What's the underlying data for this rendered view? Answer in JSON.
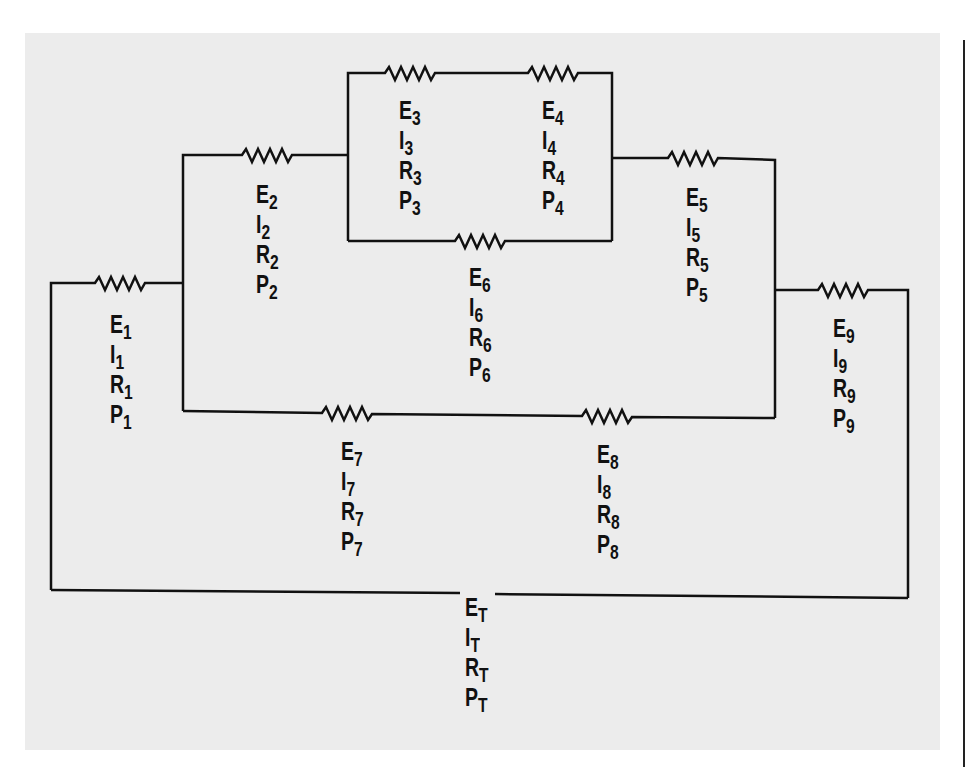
{
  "diagram": {
    "type": "series-parallel resistor circuit",
    "colors": {
      "background": "#ffffff",
      "panel": "#ececec",
      "ink": "#111111"
    },
    "components": [
      {
        "id": "R1",
        "labels": [
          {
            "sym": "E",
            "sub": "1"
          },
          {
            "sym": "I",
            "sub": "1"
          },
          {
            "sym": "R",
            "sub": "1"
          },
          {
            "sym": "P",
            "sub": "1"
          }
        ]
      },
      {
        "id": "R2",
        "labels": [
          {
            "sym": "E",
            "sub": "2"
          },
          {
            "sym": "I",
            "sub": "2"
          },
          {
            "sym": "R",
            "sub": "2"
          },
          {
            "sym": "P",
            "sub": "2"
          }
        ]
      },
      {
        "id": "R3",
        "labels": [
          {
            "sym": "E",
            "sub": "3"
          },
          {
            "sym": "I",
            "sub": "3"
          },
          {
            "sym": "R",
            "sub": "3"
          },
          {
            "sym": "P",
            "sub": "3"
          }
        ]
      },
      {
        "id": "R4",
        "labels": [
          {
            "sym": "E",
            "sub": "4"
          },
          {
            "sym": "I",
            "sub": "4"
          },
          {
            "sym": "R",
            "sub": "4"
          },
          {
            "sym": "P",
            "sub": "4"
          }
        ]
      },
      {
        "id": "R5",
        "labels": [
          {
            "sym": "E",
            "sub": "5"
          },
          {
            "sym": "I",
            "sub": "5"
          },
          {
            "sym": "R",
            "sub": "5"
          },
          {
            "sym": "P",
            "sub": "5"
          }
        ]
      },
      {
        "id": "R6",
        "labels": [
          {
            "sym": "E",
            "sub": "6"
          },
          {
            "sym": "I",
            "sub": "6"
          },
          {
            "sym": "R",
            "sub": "6"
          },
          {
            "sym": "P",
            "sub": "6"
          }
        ]
      },
      {
        "id": "R7",
        "labels": [
          {
            "sym": "E",
            "sub": "7"
          },
          {
            "sym": "I",
            "sub": "7"
          },
          {
            "sym": "R",
            "sub": "7"
          },
          {
            "sym": "P",
            "sub": "7"
          }
        ]
      },
      {
        "id": "R8",
        "labels": [
          {
            "sym": "E",
            "sub": "8"
          },
          {
            "sym": "I",
            "sub": "8"
          },
          {
            "sym": "R",
            "sub": "8"
          },
          {
            "sym": "P",
            "sub": "8"
          }
        ]
      },
      {
        "id": "R9",
        "labels": [
          {
            "sym": "E",
            "sub": "9"
          },
          {
            "sym": "I",
            "sub": "9"
          },
          {
            "sym": "R",
            "sub": "9"
          },
          {
            "sym": "P",
            "sub": "9"
          }
        ]
      },
      {
        "id": "Total",
        "labels": [
          {
            "sym": "E",
            "sub": "T"
          },
          {
            "sym": "I",
            "sub": "T"
          },
          {
            "sym": "R",
            "sub": "T"
          },
          {
            "sym": "P",
            "sub": "T"
          }
        ]
      }
    ]
  }
}
